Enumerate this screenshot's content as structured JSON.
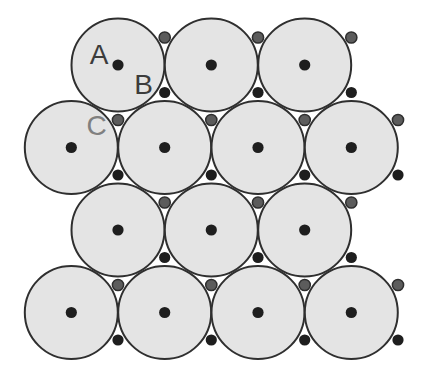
{
  "figure": {
    "name": "close-packed-spheres-layer-diagram",
    "canvas": {
      "width": 427,
      "height": 378,
      "background": "#ffffff"
    },
    "colors": {
      "sphere_fill": "#e4e4e4",
      "sphere_stroke": "#2f2f2f",
      "a_site_dot": "#1e1e1e",
      "b_site_dot": "#1e1e1e",
      "c_site_dot_fill": "#5c5c5c",
      "c_site_dot_stroke": "#2e2e2e",
      "label_a_color": "#3c3c3c",
      "label_b_color": "#3c3c3c",
      "label_c_color": "#808080"
    },
    "geometry": {
      "sphere_radius": 46.5,
      "sphere_stroke_width": 2,
      "site_dot_radius": 5.6,
      "c_dot_stroke_width": 1.5,
      "label_font_size": 28,
      "sphere_rows": [
        {
          "y": 65,
          "xs": [
            118,
            211.3,
            304.7
          ]
        },
        {
          "y": 147.5,
          "xs": [
            71.3,
            164.7,
            258,
            351.3
          ]
        },
        {
          "y": 230,
          "xs": [
            118,
            211.3,
            304.7
          ]
        },
        {
          "y": 312.5,
          "xs": [
            71.3,
            164.7,
            258,
            351.3
          ]
        }
      ],
      "b_dot_rows": [
        {
          "y": 92.5,
          "xs": [
            164.7,
            258,
            351.3
          ]
        },
        {
          "y": 175,
          "xs": [
            118,
            211.3,
            304.7,
            398
          ]
        },
        {
          "y": 257.5,
          "xs": [
            164.7,
            258,
            351.3
          ]
        },
        {
          "y": 340,
          "xs": [
            118,
            211.3,
            304.7,
            398
          ]
        }
      ],
      "c_dot_rows": [
        {
          "y": 37.5,
          "xs": [
            164.7,
            258,
            351.3
          ]
        },
        {
          "y": 120,
          "xs": [
            118,
            211.3,
            304.7,
            398
          ]
        },
        {
          "y": 202.5,
          "xs": [
            164.7,
            258,
            351.3
          ]
        },
        {
          "y": 285,
          "xs": [
            118,
            211.3,
            304.7,
            398
          ]
        }
      ]
    },
    "labels": [
      {
        "id": "a",
        "text": "A",
        "x": 99,
        "y": 54.5,
        "color_key": "label_a_color"
      },
      {
        "id": "b",
        "text": "B",
        "x": 143.5,
        "y": 84.5,
        "color_key": "label_b_color"
      },
      {
        "id": "c",
        "text": "C",
        "x": 96.5,
        "y": 125.5,
        "color_key": "label_c_color"
      }
    ]
  }
}
